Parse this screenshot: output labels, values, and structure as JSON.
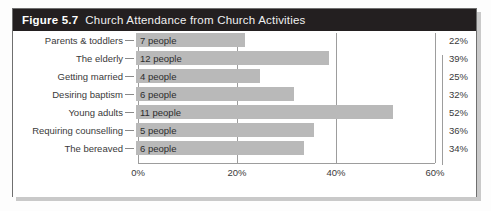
{
  "figure": {
    "number_label": "Figure 5.7",
    "caption": "Church Attendance from Church Activities"
  },
  "chart_data": {
    "type": "bar",
    "orientation": "horizontal",
    "title": "Church Attendance from Church Activities",
    "xlabel": "",
    "ylabel": "",
    "xlim": [
      0,
      60
    ],
    "xticks": [
      "0%",
      "20%",
      "40%",
      "60%"
    ],
    "xtick_values": [
      0,
      20,
      40,
      60
    ],
    "grid": true,
    "legend": false,
    "categories": [
      "Parents & toddlers",
      "The elderly",
      "Getting married",
      "Desiring baptism",
      "Young adults",
      "Requiring counselling",
      "The bereaved"
    ],
    "values": [
      22,
      39,
      25,
      32,
      52,
      36,
      34
    ],
    "bar_labels": [
      "7 people",
      "12 people",
      "4 people",
      "6 people",
      "11 people",
      "5 people",
      "6 people"
    ],
    "people_counts": [
      7,
      12,
      4,
      6,
      11,
      5,
      6
    ],
    "percent_labels": [
      "22%",
      "39%",
      "25%",
      "32%",
      "52%",
      "36%",
      "34%"
    ],
    "bar_color": "#b9b9b9",
    "header_color": "#231f20",
    "grid_color": "#9d9d9d"
  }
}
